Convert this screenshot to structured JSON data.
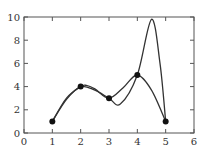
{
  "chart_data": {
    "type": "line",
    "title": "",
    "xlabel": "",
    "ylabel": "",
    "xlim": [
      0,
      6
    ],
    "ylim": [
      0,
      10
    ],
    "x_ticks": [
      "0",
      "1",
      "2",
      "3",
      "4",
      "5",
      "6"
    ],
    "y_ticks": [
      "0",
      "2",
      "4",
      "6",
      "8",
      "10"
    ],
    "grid": false,
    "legend": null,
    "points": [
      {
        "x": 1,
        "y": 1
      },
      {
        "x": 2,
        "y": 4
      },
      {
        "x": 3,
        "y": 3
      },
      {
        "x": 4,
        "y": 5
      },
      {
        "x": 5,
        "y": 1
      }
    ],
    "series": [
      {
        "name": "curve-a",
        "description": "interpolating curve with dip and tall overshoot",
        "x": [
          1,
          1.5,
          2,
          2.5,
          3,
          3.4,
          4,
          4.5,
          4.8,
          5
        ],
        "y": [
          1,
          2.9,
          4,
          3.7,
          3,
          2.5,
          5,
          9.8,
          6,
          1
        ]
      },
      {
        "name": "curve-b",
        "description": "smoother interpolating curve",
        "x": [
          1,
          1.5,
          2,
          2.2,
          2.5,
          3,
          3.5,
          4,
          4.5,
          5
        ],
        "y": [
          1,
          3,
          4,
          4.1,
          3.8,
          3,
          3.9,
          5,
          3.7,
          1
        ]
      }
    ],
    "colors": {
      "line": "#333333",
      "marker": "#111111",
      "axis": "#555555"
    }
  }
}
